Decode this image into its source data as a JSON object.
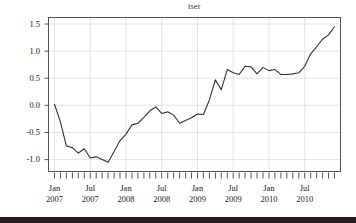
{
  "chart_data": {
    "type": "line",
    "title": "tser",
    "xlabel": "",
    "ylabel": "",
    "grid": true,
    "legend": "none",
    "line_color": "#333333",
    "frame_color": "#555555",
    "grid_color": "#d9d9d9",
    "ylim": [
      -1.22,
      1.62
    ],
    "yticks": [
      1.5,
      1.0,
      0.5,
      0.0,
      -0.5,
      -1.0
    ],
    "ytick_labels": [
      "1.5",
      "1.0",
      "0.5",
      "0.0",
      "-0.5",
      "-1.0"
    ],
    "xticks": [
      0,
      6,
      12,
      18,
      24,
      30,
      36,
      42
    ],
    "xtick_labels": [
      {
        "month": "Jan",
        "year": "2007"
      },
      {
        "month": "Jul",
        "year": "2007"
      },
      {
        "month": "Jan",
        "year": "2008"
      },
      {
        "month": "Jul",
        "year": "2008"
      },
      {
        "month": "Jan",
        "year": "2009"
      },
      {
        "month": "Jul",
        "year": "2009"
      },
      {
        "month": "Jan",
        "year": "2010"
      },
      {
        "month": "Jul",
        "year": "2010"
      }
    ],
    "minor_tick_count": 48,
    "x": [
      "2007-01",
      "2007-02",
      "2007-03",
      "2007-04",
      "2007-05",
      "2007-06",
      "2007-07",
      "2007-08",
      "2007-09",
      "2007-10",
      "2007-11",
      "2007-12",
      "2008-01",
      "2008-02",
      "2008-03",
      "2008-04",
      "2008-05",
      "2008-06",
      "2008-07",
      "2008-08",
      "2008-09",
      "2008-10",
      "2008-11",
      "2008-12",
      "2009-01",
      "2009-02",
      "2009-03",
      "2009-04",
      "2009-05",
      "2009-06",
      "2009-07",
      "2009-08",
      "2009-09",
      "2009-10",
      "2009-11",
      "2009-12",
      "2010-01",
      "2010-02",
      "2010-03",
      "2010-04",
      "2010-05",
      "2010-06",
      "2010-07",
      "2010-08",
      "2010-09",
      "2010-10",
      "2010-11",
      "2010-12"
    ],
    "values": [
      0.02,
      -0.31,
      -0.75,
      -0.78,
      -0.88,
      -0.8,
      -0.97,
      -0.95,
      -1.0,
      -1.05,
      -0.85,
      -0.65,
      -0.53,
      -0.36,
      -0.33,
      -0.22,
      -0.1,
      -0.03,
      -0.15,
      -0.12,
      -0.18,
      -0.33,
      -0.28,
      -0.23,
      -0.16,
      -0.17,
      0.1,
      0.47,
      0.29,
      0.66,
      0.6,
      0.57,
      0.72,
      0.71,
      0.58,
      0.7,
      0.64,
      0.66,
      0.57,
      0.57,
      0.58,
      0.6,
      0.72,
      0.95,
      1.08,
      1.22,
      1.3,
      1.45
    ],
    "series_name": "tser"
  },
  "figure": {
    "background": "#ffffff",
    "footer_bar_color": "#231f20"
  }
}
